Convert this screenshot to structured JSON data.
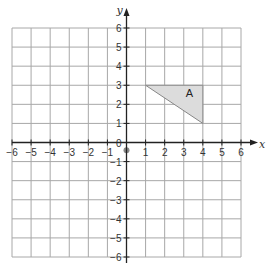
{
  "chart_data": {
    "type": "scatter",
    "title": "",
    "xlabel": "x",
    "ylabel": "y",
    "xlim": [
      -6,
      6
    ],
    "ylim": [
      -6,
      6
    ],
    "grid": true,
    "x_ticks": [
      -6,
      -5,
      -4,
      -3,
      -2,
      -1,
      1,
      2,
      3,
      4,
      5,
      6
    ],
    "y_ticks": [
      6,
      5,
      4,
      3,
      2,
      1,
      0,
      -1,
      -2,
      -3,
      -4,
      -5,
      -6
    ],
    "x_tick_labels": [
      "−6",
      "−5",
      "−4",
      "−3",
      "−2",
      "−1",
      "1",
      "2",
      "3",
      "4",
      "5",
      "6"
    ],
    "y_tick_labels": [
      "6",
      "5",
      "4",
      "3",
      "2",
      "1",
      "0",
      "−1",
      "−2",
      "−3",
      "−4",
      "−5",
      "−6"
    ],
    "shapes": [
      {
        "label": "A",
        "vertices": [
          [
            1,
            3
          ],
          [
            4,
            3
          ],
          [
            4,
            1
          ]
        ],
        "label_position": [
          3.3,
          2.6
        ],
        "fill": "#dcdcdc",
        "stroke": "#888888"
      }
    ],
    "points": [
      {
        "x": 0,
        "y": -0.4,
        "label": "",
        "color": "#888888"
      }
    ]
  }
}
